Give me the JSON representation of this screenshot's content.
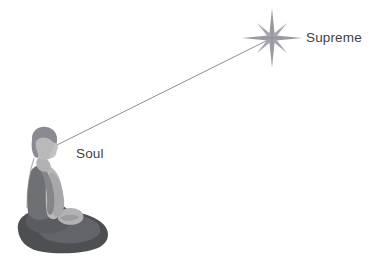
{
  "diagram": {
    "type": "illustration",
    "background_color": "#ffffff",
    "labels": [
      {
        "id": "supreme",
        "text": "Supreme",
        "color": "#3f3f43",
        "x": 306,
        "y": 31
      },
      {
        "id": "soul",
        "text": "Soul",
        "color": "#3f3f43",
        "x": 76,
        "y": 147
      }
    ],
    "star": {
      "name": "sparkle-star",
      "center_x": 272,
      "center_y": 38,
      "long_ray": 30,
      "short_ray": 20,
      "color": "#9a9aa2"
    },
    "connector": {
      "name": "aspiration-line",
      "from_x": 57,
      "from_y": 145,
      "to_x": 268,
      "to_y": 40,
      "color": "#8e8e96",
      "width": 1
    },
    "figure": {
      "name": "meditating-person",
      "pose": "seated-cross-legged",
      "colors": {
        "hair": "#8a8a90",
        "skin": "#b9b9b9",
        "skin_shadow": "#a6a6a8",
        "shirt": "#6f7074",
        "shirt_light": "#9d9ea2",
        "pants": "#5b5c60",
        "pants_dark": "#4c4d51",
        "outline": "#7b7c80"
      }
    }
  }
}
